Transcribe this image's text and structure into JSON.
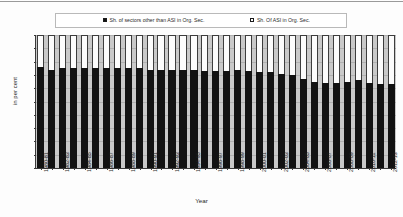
{
  "chart_data": {
    "type": "bar",
    "stacked": true,
    "title": "",
    "xlabel": "Year",
    "ylabel": "in per cent",
    "ylim": [
      0,
      100
    ],
    "yticks": [
      0,
      10,
      20,
      30,
      40,
      50,
      60,
      70,
      80,
      90,
      100
    ],
    "grid": true,
    "legend_position": "top",
    "legend": [
      {
        "label": "Sh. of  sectors other than ASI in Org. Sec.",
        "marker": "filled-square",
        "color": "#121212"
      },
      {
        "label": "Sh. Of ASI in Org. Sec.",
        "marker": "open-square",
        "color": "#fcfcfc"
      }
    ],
    "categories": [
      "1980-81",
      "1981-82",
      "1982-83",
      "1983-84",
      "1984-85",
      "1985-86",
      "1986-87",
      "1987-88",
      "1988-89",
      "1989-90",
      "1990-91",
      "1991-92",
      "1992-93",
      "1993-94",
      "1994-95",
      "1995-96",
      "1996-97",
      "1997-98",
      "1998-99",
      "1999-00",
      "2000-01",
      "2001-02",
      "2002-03",
      "2003-04",
      "2004-05",
      "2005-06",
      "2006-07",
      "2007-08",
      "2008-09",
      "2009-10",
      "2010-11",
      "2011-12",
      "2012-13"
    ],
    "tick_labels_shown": [
      "1980-81",
      "1982-83",
      "1984-85",
      "1986-87",
      "1988-89",
      "1990-91",
      "1992-93",
      "1994-95",
      "1996-97",
      "1998-99",
      "2000-01",
      "2002-03",
      "2004-05",
      "2006-07",
      "2008-09",
      "2010-11",
      "2012-13"
    ],
    "series": [
      {
        "name": "Sh. of  sectors other than ASI in Org. Sec.",
        "color": "#121212",
        "values": [
          76,
          74,
          75,
          75,
          75,
          75,
          75,
          75,
          75,
          75,
          74,
          74,
          74,
          74,
          74,
          73,
          73,
          73,
          74,
          73,
          72,
          72,
          71,
          70,
          67,
          65,
          64,
          64,
          65,
          66,
          64,
          63,
          63
        ]
      },
      {
        "name": "Sh. Of ASI in Org. Sec.",
        "color": "#fcfcfc",
        "values": [
          24,
          26,
          25,
          25,
          25,
          25,
          25,
          25,
          25,
          25,
          26,
          26,
          26,
          26,
          26,
          27,
          27,
          27,
          26,
          27,
          28,
          28,
          29,
          30,
          33,
          35,
          36,
          36,
          35,
          34,
          36,
          37,
          37
        ]
      }
    ]
  }
}
